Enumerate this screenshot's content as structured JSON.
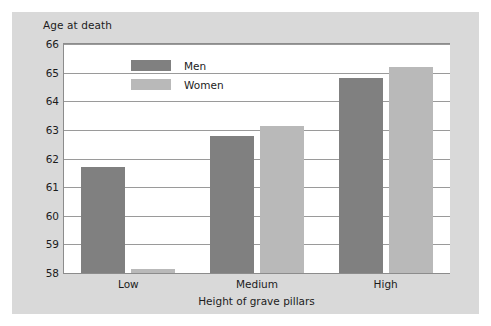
{
  "chart_data": {
    "type": "bar",
    "title": "",
    "xlabel": "Height of grave pillars",
    "ylabel": "Age at death",
    "categories": [
      "Low",
      "Medium",
      "High"
    ],
    "series": [
      {
        "name": "Men",
        "color": "#808080",
        "values": [
          61.7,
          62.8,
          64.8
        ]
      },
      {
        "name": "Women",
        "color": "#b9b9b9",
        "values": [
          58.15,
          63.15,
          65.2
        ]
      }
    ],
    "ylim": [
      58,
      66
    ],
    "yticks": [
      58,
      59,
      60,
      61,
      62,
      63,
      64,
      65,
      66
    ],
    "ytick_labels": [
      "58",
      "59",
      "60",
      "61",
      "62",
      "63",
      "64",
      "65",
      "66"
    ],
    "grid": true,
    "legend_position": "top-left-inside"
  },
  "colors": {
    "figure_background": "#d9d9d9",
    "plot_background": "#ffffff",
    "axis": "#8c8c8c",
    "gridline": "#9a9a9a",
    "text": "#1c1c1c",
    "men": "#808080",
    "women": "#b9b9b9"
  }
}
